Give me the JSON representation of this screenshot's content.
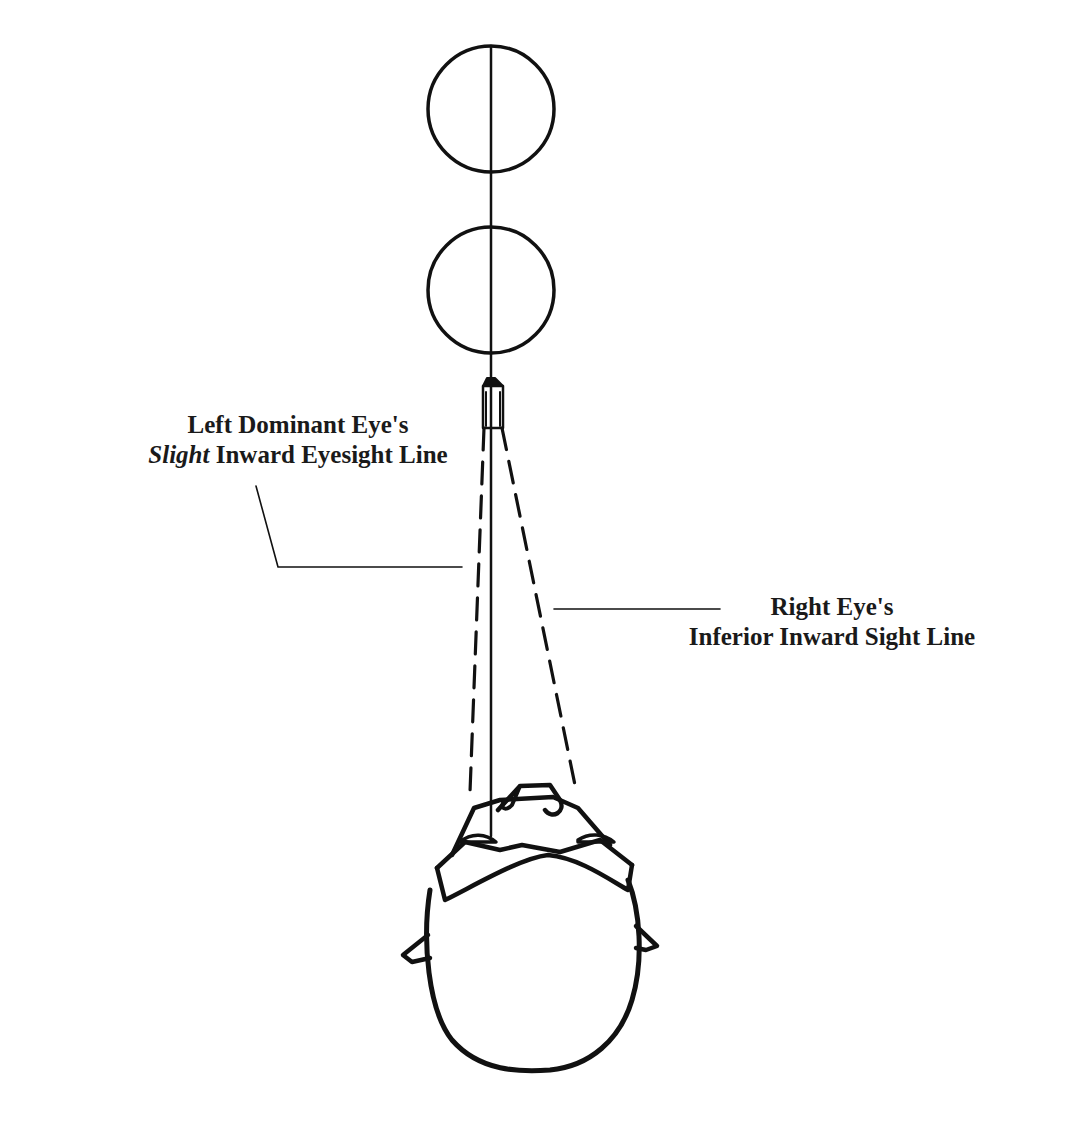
{
  "diagram": {
    "labels": {
      "left_eye": {
        "line1": "Left Dominant Eye's",
        "line2_emphasis": "Slight",
        "line2_rest": " Inward Eyesight Line"
      },
      "right_eye": {
        "line1": "Right Eye's",
        "line2": "Inferior Inward Sight Line"
      }
    },
    "elements": [
      {
        "name": "target-circle-far",
        "kind": "circle"
      },
      {
        "name": "target-circle-near",
        "kind": "circle"
      },
      {
        "name": "center-sight-axis",
        "kind": "line"
      },
      {
        "name": "sighting-device",
        "kind": "shape"
      },
      {
        "name": "left-eye-sight-line",
        "kind": "dashed-line"
      },
      {
        "name": "right-eye-sight-line",
        "kind": "dashed-line"
      },
      {
        "name": "head-top-view",
        "kind": "shape"
      }
    ],
    "colors": {
      "ink": "#111111",
      "paper": "#ffffff"
    }
  }
}
